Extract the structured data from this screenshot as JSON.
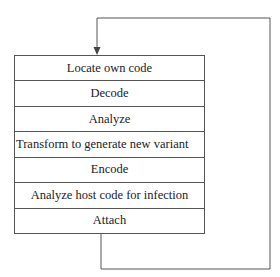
{
  "diagram": {
    "type": "flow-loop",
    "steps": [
      {
        "label": "Locate own code",
        "align": "center"
      },
      {
        "label": "Decode",
        "align": "center"
      },
      {
        "label": "Analyze",
        "align": "center"
      },
      {
        "label": "Transform to generate new variant",
        "align": "left"
      },
      {
        "label": "Encode",
        "align": "center"
      },
      {
        "label": "Analyze host code for infection",
        "align": "center"
      },
      {
        "label": "Attach",
        "align": "center"
      }
    ],
    "loop": {
      "from": "Attach",
      "to": "Locate own code",
      "description": "Arrow loops from bottom of Attach around the right side back to the top of Locate own code"
    },
    "colors": {
      "line": "#555555",
      "text": "#222222",
      "background": "#ffffff"
    }
  }
}
